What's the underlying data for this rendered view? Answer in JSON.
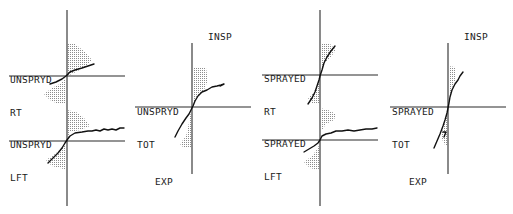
{
  "figure": {
    "panels": [
      {
        "id": "unspryd-rt-lft",
        "groups": [
          {
            "label_line1": "UNSPRYD",
            "label_line2": "RT"
          },
          {
            "label_line1": "UNSPRYD",
            "label_line2": "LFT"
          }
        ]
      },
      {
        "id": "unspryd-tot",
        "label_line1": "UNSPRYD",
        "label_line2": "TOT",
        "top_label": "INSP",
        "bottom_label": "EXP"
      },
      {
        "id": "sprayed-rt-lft",
        "groups": [
          {
            "label_line1": "SPRAYED",
            "label_line2": "RT"
          },
          {
            "label_line1": "SPRAYED",
            "label_line2": "LFT"
          }
        ]
      },
      {
        "id": "sprayed-tot",
        "label_line1": "SPRAYED",
        "label_line2": "TOT",
        "top_label": "INSP",
        "bottom_label": "EXP"
      }
    ]
  },
  "colors": {
    "ink": "#111111",
    "shading": "#9a9a9a",
    "background": "#ffffff"
  }
}
